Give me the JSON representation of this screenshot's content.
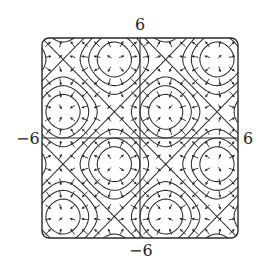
{
  "chart_data": {
    "type": "contour",
    "title": "",
    "function": "f(x, y) = sin(x) + sin(y)",
    "overlay": "gradient vector field",
    "xlim": [
      -6,
      6
    ],
    "ylim": [
      -6,
      6
    ],
    "xlabel": "",
    "ylabel": "",
    "tick_labels": {
      "top": "6",
      "bottom": "−6",
      "left": "−6",
      "right": "6"
    },
    "contour_levels": [
      -1.5,
      -1.0,
      -0.5,
      0,
      0.5,
      1.0,
      1.5
    ],
    "extrema": {
      "maxima": [
        [
          1.57,
          1.57
        ],
        [
          -4.71,
          1.57
        ],
        [
          1.57,
          -4.71
        ],
        [
          -4.71,
          -4.71
        ]
      ],
      "minima": [
        [
          -1.57,
          -1.57
        ],
        [
          4.71,
          -1.57
        ],
        [
          -1.57,
          4.71
        ],
        [
          4.71,
          4.71
        ]
      ],
      "saddles": [
        [
          1.57,
          -1.57
        ],
        [
          -1.57,
          1.57
        ],
        [
          4.71,
          1.57
        ],
        [
          1.57,
          4.71
        ],
        [
          -4.71,
          -1.57
        ],
        [
          -1.57,
          -4.71
        ],
        [
          4.71,
          -4.71
        ],
        [
          -4.71,
          4.71
        ]
      ]
    },
    "arrow_grid_spacing": 0.75,
    "grid": false,
    "axes_through_origin": true,
    "frame": "rounded-square",
    "colors": {
      "line": "#2a2a2a",
      "background": "#ffffff"
    }
  }
}
